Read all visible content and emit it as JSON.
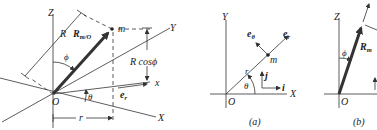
{
  "figure_left": {
    "axis_Z": "Z",
    "axis_Y": "Y",
    "axis_X": "X",
    "axis_x": "x",
    "origin": "O",
    "mass": "m",
    "vector_main": "R",
    "vector_sub": "m/O",
    "length_R": "R",
    "height_label": "R cosϕ",
    "angle_phi": "ϕ",
    "angle_theta": "θ",
    "unit_er_main": "e",
    "unit_er_sub": "r",
    "radius_r": "r"
  },
  "figure_a": {
    "caption": "(a)",
    "axis_Y": "Y",
    "axis_X": "X",
    "origin": "O",
    "mass": "m",
    "radius_r": "r",
    "angle_theta": "θ",
    "unit_etheta_main": "e",
    "unit_etheta_sub": "θ",
    "unit_er_main": "e",
    "unit_er_sub": "r",
    "unit_i": "i",
    "unit_j": "j"
  },
  "figure_b": {
    "caption": "(b)",
    "axis_Z": "Z",
    "origin": "O",
    "angle_phi": "ϕ",
    "vector_main": "R",
    "vector_sub": "m"
  }
}
